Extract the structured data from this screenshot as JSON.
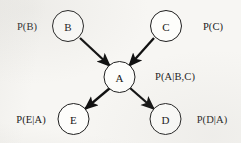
{
  "diagram": {
    "background_color": "#f7f6f3",
    "stroke_color": "#1a1a1a",
    "node_fill": "#fdfdfb",
    "node_radius": 15.5,
    "nodes": [
      {
        "id": "B",
        "label": "B",
        "cx": 68,
        "cy": 26
      },
      {
        "id": "C",
        "label": "C",
        "cx": 166,
        "cy": 26
      },
      {
        "id": "A",
        "label": "A",
        "cx": 119.5,
        "cy": 77
      },
      {
        "id": "E",
        "label": "E",
        "cx": 73.5,
        "cy": 119
      },
      {
        "id": "D",
        "label": "D",
        "cx": 165.5,
        "cy": 119
      }
    ],
    "edges": [
      {
        "from": "B",
        "to": "A",
        "x1": 80,
        "y1": 38,
        "x2": 110,
        "y2": 66
      },
      {
        "from": "C",
        "to": "A",
        "x1": 154,
        "y1": 38,
        "x2": 129,
        "y2": 66
      },
      {
        "from": "A",
        "to": "E",
        "x1": 110,
        "y1": 88,
        "x2": 85,
        "y2": 109
      },
      {
        "from": "A",
        "to": "D",
        "x1": 130,
        "y1": 88,
        "x2": 154,
        "y2": 109
      }
    ],
    "probability_labels": [
      {
        "id": "p-b",
        "text": "P(B)",
        "cx": 27,
        "cy": 26
      },
      {
        "id": "p-c",
        "text": "P(C)",
        "cx": 213,
        "cy": 26
      },
      {
        "id": "p-a-bc",
        "text": "P(A|B,C)",
        "cx": 175,
        "cy": 76
      },
      {
        "id": "p-e-a",
        "text": "P(E|A)",
        "cx": 31,
        "cy": 119
      },
      {
        "id": "p-d-a",
        "text": "P(D|A)",
        "cx": 212,
        "cy": 119
      }
    ]
  }
}
